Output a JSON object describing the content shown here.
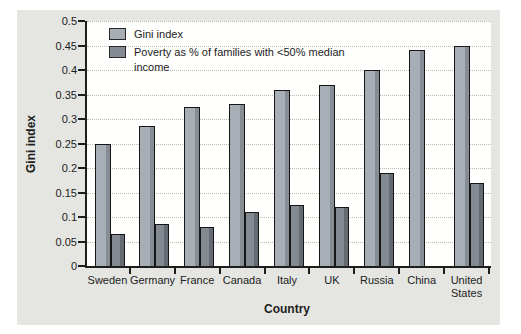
{
  "figure": {
    "panel_background": "#e5e6e1",
    "plot_background": "#fffffd",
    "axis_color": "#1d1d1d",
    "gridline_color": "#b9bab4"
  },
  "chart_data": {
    "type": "bar",
    "title": "",
    "xlabel": "Country",
    "ylabel": "Gini index",
    "ylim": [
      0,
      0.5
    ],
    "ytick_step": 0.05,
    "yticks": [
      0,
      0.05,
      0.1,
      0.15,
      0.2,
      0.25,
      0.3,
      0.35,
      0.4,
      0.45,
      0.5
    ],
    "grid": "horizontal-dotted",
    "legend_position": "top-left-inside",
    "categories": [
      "Sweden",
      "Germany",
      "France",
      "Canada",
      "Italy",
      "UK",
      "Russia",
      "China",
      "United States"
    ],
    "series": [
      {
        "name": "Gini index",
        "color": "#a7aeb5",
        "shade": "#868d94",
        "values": [
          0.25,
          0.285,
          0.325,
          0.33,
          0.36,
          0.37,
          0.4,
          0.44,
          0.45
        ]
      },
      {
        "name": "Poverty as % of families with <50% median income",
        "color": "#838a92",
        "shade": "#646b72",
        "values": [
          0.065,
          0.085,
          0.08,
          0.11,
          0.125,
          0.12,
          0.19,
          null,
          0.17
        ]
      }
    ]
  }
}
